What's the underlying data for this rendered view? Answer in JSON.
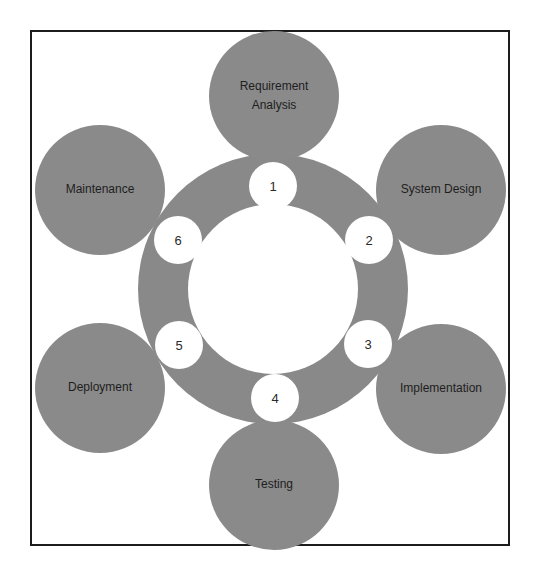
{
  "diagram": {
    "title": "",
    "colors": {
      "shape_fill": "#898989",
      "background": "#ffffff",
      "border": "#1c1c1c",
      "text": "#1e1e1e"
    },
    "center": {
      "x": 273,
      "y": 289
    },
    "ring": {
      "outer_radius": 135,
      "inner_radius": 85
    },
    "phases": [
      {
        "step": "1",
        "label": "Requirement Analysis",
        "cx": 274,
        "cy": 96
      },
      {
        "step": "2",
        "label": "System Design",
        "cx": 441,
        "cy": 190
      },
      {
        "step": "3",
        "label": "Implementation",
        "cx": 441,
        "cy": 389
      },
      {
        "step": "4",
        "label": "Testing",
        "cx": 274,
        "cy": 485
      },
      {
        "step": "5",
        "label": "Deployment",
        "cx": 100,
        "cy": 388
      },
      {
        "step": "6",
        "label": "Maintenance",
        "cx": 100,
        "cy": 190
      }
    ],
    "steps": [
      {
        "label": "1",
        "cx": 273,
        "cy": 186
      },
      {
        "label": "2",
        "cx": 369,
        "cy": 240
      },
      {
        "label": "3",
        "cx": 368,
        "cy": 344
      },
      {
        "label": "4",
        "cx": 275,
        "cy": 398
      },
      {
        "label": "5",
        "cx": 179,
        "cy": 345
      },
      {
        "label": "6",
        "cx": 178,
        "cy": 240
      }
    ]
  }
}
